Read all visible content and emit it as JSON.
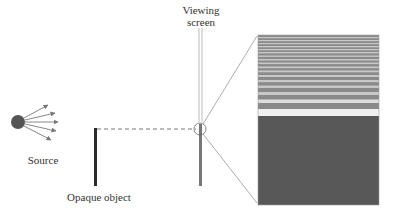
{
  "labels": {
    "source": "Source",
    "opaque_object": "Opaque object",
    "viewing_screen_line1": "Viewing",
    "viewing_screen_line2": "screen"
  },
  "colors": {
    "source_fill": "#555555",
    "object": "#2a2a2a",
    "screen": "#777777",
    "pattern_dark": "#555555",
    "pattern_light": "#e8e8e8"
  }
}
